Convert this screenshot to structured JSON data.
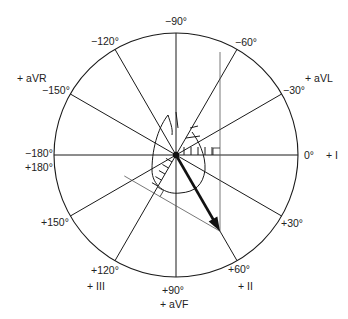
{
  "diagram": {
    "center": [
      176,
      155
    ],
    "radius": 122,
    "axis_angle_deg": 60,
    "colors": {
      "line": "#1a1a1a",
      "thin_line": "#555555",
      "arrow": "#111111",
      "background": "#ffffff"
    },
    "angle_labels": [
      {
        "text": "−90°",
        "x": 165,
        "y": 15
      },
      {
        "text": "−60°",
        "x": 235,
        "y": 36
      },
      {
        "text": "−30°",
        "x": 283,
        "y": 84
      },
      {
        "text": "0°",
        "x": 304,
        "y": 149
      },
      {
        "text": "+30°",
        "x": 281,
        "y": 217
      },
      {
        "text": "+60°",
        "x": 228,
        "y": 263
      },
      {
        "text": "+90°",
        "x": 162,
        "y": 284
      },
      {
        "text": "+120°",
        "x": 91,
        "y": 264
      },
      {
        "text": "+150°",
        "x": 41,
        "y": 216
      },
      {
        "text": "+180°",
        "x": 25,
        "y": 161
      },
      {
        "text": "−180°",
        "x": 25,
        "y": 147
      },
      {
        "text": "−150°",
        "x": 42,
        "y": 84
      },
      {
        "text": "−120°",
        "x": 91,
        "y": 35
      }
    ],
    "lead_labels": [
      {
        "text": "+ I",
        "x": 326,
        "y": 149
      },
      {
        "text": "+ aVL",
        "x": 305,
        "y": 72
      },
      {
        "text": "+ aVR",
        "x": 17,
        "y": 72
      },
      {
        "text": "+ II",
        "x": 238,
        "y": 280
      },
      {
        "text": "+ III",
        "x": 87,
        "y": 280
      },
      {
        "text": "+ aVF",
        "x": 160,
        "y": 298
      }
    ]
  }
}
